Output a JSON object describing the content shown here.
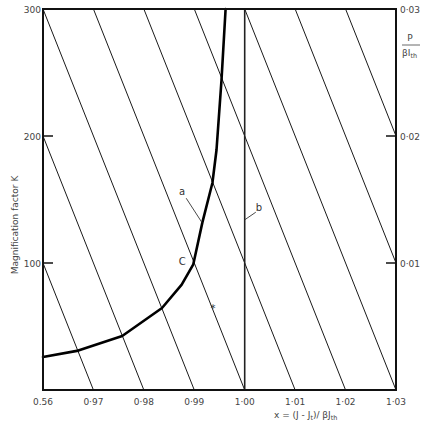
{
  "chart_data": {
    "type": "line",
    "title": "",
    "xlabel": "x = (J - J",
    "xlabel_sub1": "t",
    "xlabel_mid": ")/ βJ",
    "xlabel_sub2": "th",
    "ylabel": "Magnification factor K",
    "y2label_numerator": "P",
    "y2label_denominator": "βI",
    "y2label_denominator_sub": "th",
    "xlim": [
      0.96,
      1.03
    ],
    "ylim": [
      0,
      300
    ],
    "y2lim": [
      0,
      0.03
    ],
    "grid": false,
    "legend": "none",
    "x_ticks": [
      0.96,
      0.97,
      0.98,
      0.99,
      1.0,
      1.01,
      1.02,
      1.03
    ],
    "x_tick_labels": [
      "0.56",
      "0·97",
      "0·98",
      "0·99",
      "1·00",
      "1·01",
      "1·02",
      "1·03"
    ],
    "y_ticks": [
      100,
      200,
      300
    ],
    "y_tick_labels": [
      "100",
      "200",
      "300"
    ],
    "y2_ticks": [
      0.01,
      0.02,
      0.03
    ],
    "y2_tick_labels": [
      "0·01",
      "0·02",
      "0·03"
    ],
    "series": [
      {
        "name": "a",
        "style": "thick curve",
        "points": [
          [
            0.96,
            26
          ],
          [
            0.967,
            31
          ],
          [
            0.9757,
            42.5
          ],
          [
            0.9836,
            64.6
          ],
          [
            0.9875,
            83
          ],
          [
            0.9898,
            99
          ],
          [
            0.9916,
            132
          ],
          [
            0.9936,
            163
          ],
          [
            0.9944,
            189
          ],
          [
            0.9954,
            244
          ],
          [
            0.9962,
            300
          ]
        ]
      },
      {
        "name": "b",
        "style": "vertical line",
        "points": [
          [
            1.0,
            0
          ],
          [
            1.0,
            300
          ]
        ]
      }
    ],
    "constant_power_lines": {
      "description": "straight lines x = x0 - 0.0001·K (i.e. constant P/βI_th offset)",
      "slope_dx_per_K": -0.0001,
      "x0": [
        0.97,
        0.98,
        0.99,
        1.0,
        1.01,
        1.02,
        1.03,
        1.04,
        1.05
      ]
    },
    "annotations": [
      {
        "text": "a",
        "x": 0.9876,
        "K": 156,
        "leader_from": [
          0.9884,
          151
        ],
        "leader_to": [
          0.9915,
          132
        ]
      },
      {
        "text": "b",
        "x": 1.0028,
        "K": 144,
        "leader_from": [
          1.0022,
          140
        ],
        "leader_to": [
          1.0,
          134
        ]
      },
      {
        "text": "C",
        "x": 0.9876,
        "K": 101
      },
      {
        "text": "*",
        "x": 0.9937,
        "K": 64
      }
    ]
  }
}
